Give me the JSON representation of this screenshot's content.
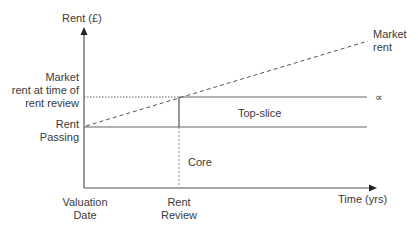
{
  "diagram": {
    "y_axis_label": "Rent (£)",
    "x_axis_label": "Time (yrs)",
    "left_labels": {
      "market_rent_at_review": [
        "Market",
        "rent at time of",
        "rent review"
      ],
      "rent_passing": [
        "Rent",
        "Passing"
      ]
    },
    "bottom_labels": {
      "valuation_date": [
        "Valuation",
        "Date"
      ],
      "rent_review": [
        "Rent",
        "Review"
      ]
    },
    "line_labels": {
      "market_rent": [
        "Market",
        "rent"
      ],
      "infinity_symbol": "∝",
      "top_slice": "Top-slice",
      "core": "Core"
    },
    "colors": {
      "axis": "#555555",
      "line": "#666666",
      "text": "#3a3a3a"
    }
  }
}
